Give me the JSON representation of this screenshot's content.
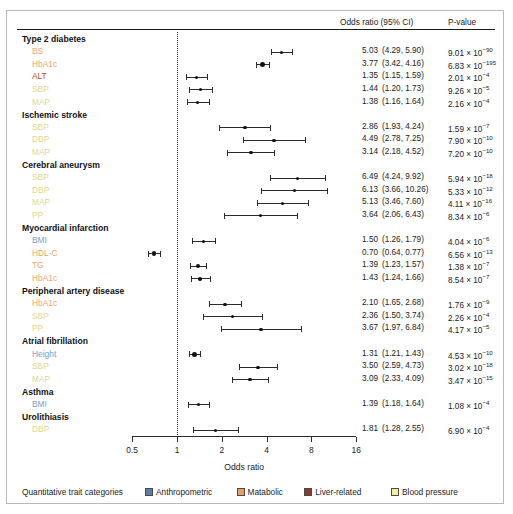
{
  "header": {
    "or_col": "Odds ratio (95% CI)",
    "p_col": "P-value"
  },
  "axis": {
    "title": "Odds ratio",
    "ticks": [
      "0.5",
      "1",
      "2",
      "4",
      "8",
      "16"
    ],
    "tick_values": [
      0.5,
      1,
      2,
      4,
      8,
      16
    ],
    "reference": 1
  },
  "legend": {
    "title": "Quantitative trait categories",
    "items": [
      {
        "label": "Anthropometric",
        "color": "#5b7fa6"
      },
      {
        "label": "Matabolic",
        "color": "#e8a05c"
      },
      {
        "label": "Liver-related",
        "color": "#8c3b22"
      },
      {
        "label": "Blood pressure",
        "color": "#f2f0a0"
      }
    ]
  },
  "colors": {
    "anthropometric": "#7b9ec4",
    "metabolic": "#eda96a",
    "liver": "#b2502f",
    "blood_pressure": "#ded98a"
  },
  "chart_data": {
    "type": "forest",
    "title": "",
    "xlabel": "Odds ratio",
    "ylabel": "",
    "xscale": "log2",
    "xlim": [
      0.5,
      16
    ],
    "xticks": [
      0.5,
      1,
      2,
      4,
      8,
      16
    ],
    "reference_line": 1,
    "grid": false,
    "legend_position": "bottom",
    "columns": [
      "Odds ratio (95% CI)",
      "P-value"
    ],
    "groups": [
      {
        "name": "Type 2 diabetes",
        "rows": [
          {
            "trait": "BS",
            "category": "metabolic",
            "or": 5.03,
            "lo": 4.29,
            "hi": 5.9,
            "or_text": "5.03",
            "ci_text": "(4.29,  5.90)",
            "p_mant": "9.01 × 10",
            "p_exp": "−90"
          },
          {
            "trait": "HbA1c",
            "category": "metabolic",
            "or": 3.77,
            "lo": 3.42,
            "hi": 4.16,
            "or_text": "3.77",
            "ci_text": "(3.42,  4.16)",
            "p_mant": "6.83 × 10",
            "p_exp": "−195"
          },
          {
            "trait": "ALT",
            "category": "liver",
            "or": 1.35,
            "lo": 1.15,
            "hi": 1.59,
            "or_text": "1.35",
            "ci_text": "(1.15,  1.59)",
            "p_mant": "2.01 × 10",
            "p_exp": "−4"
          },
          {
            "trait": "SBP",
            "category": "blood_pressure",
            "or": 1.44,
            "lo": 1.2,
            "hi": 1.73,
            "or_text": "1.44",
            "ci_text": "(1.20,  1.73)",
            "p_mant": "9.26 × 10",
            "p_exp": "−5"
          },
          {
            "trait": "MAP",
            "category": "blood_pressure",
            "or": 1.38,
            "lo": 1.16,
            "hi": 1.64,
            "or_text": "1.38",
            "ci_text": "(1.16,  1.64)",
            "p_mant": "2.16 × 10",
            "p_exp": "−4"
          }
        ]
      },
      {
        "name": "Ischemic stroke",
        "rows": [
          {
            "trait": "SBP",
            "category": "blood_pressure",
            "or": 2.86,
            "lo": 1.93,
            "hi": 4.24,
            "or_text": "2.86",
            "ci_text": "(1.93,  4.24)",
            "p_mant": "1.59 × 10",
            "p_exp": "−7"
          },
          {
            "trait": "DBP",
            "category": "blood_pressure",
            "or": 4.49,
            "lo": 2.78,
            "hi": 7.25,
            "or_text": "4.49",
            "ci_text": "(2.78,  7.25)",
            "p_mant": "7.90 × 10",
            "p_exp": "−10"
          },
          {
            "trait": "MAP",
            "category": "blood_pressure",
            "or": 3.14,
            "lo": 2.18,
            "hi": 4.52,
            "or_text": "3.14",
            "ci_text": "(2.18,  4.52)",
            "p_mant": "7.20 × 10",
            "p_exp": "−10"
          }
        ]
      },
      {
        "name": "Cerebral aneurysm",
        "rows": [
          {
            "trait": "SBP",
            "category": "blood_pressure",
            "or": 6.49,
            "lo": 4.24,
            "hi": 9.92,
            "or_text": "6.49",
            "ci_text": "(4.24,  9.92)",
            "p_mant": "5.94 × 10",
            "p_exp": "−18"
          },
          {
            "trait": "DBP",
            "category": "blood_pressure",
            "or": 6.13,
            "lo": 3.66,
            "hi": 10.26,
            "or_text": "6.13",
            "ci_text": "(3.66, 10.26)",
            "p_mant": "5.33 × 10",
            "p_exp": "−12"
          },
          {
            "trait": "MAP",
            "category": "blood_pressure",
            "or": 5.13,
            "lo": 3.46,
            "hi": 7.6,
            "or_text": "5.13",
            "ci_text": "(3.46,  7.60)",
            "p_mant": "4.11 × 10",
            "p_exp": "−16"
          },
          {
            "trait": "PP",
            "category": "blood_pressure",
            "or": 3.64,
            "lo": 2.06,
            "hi": 6.43,
            "or_text": "3.64",
            "ci_text": "(2.06,  6.43)",
            "p_mant": "8.34 × 10",
            "p_exp": "−6"
          }
        ]
      },
      {
        "name": "Myocardial infarction",
        "rows": [
          {
            "trait": "BMI",
            "category": "anthropometric",
            "or": 1.5,
            "lo": 1.26,
            "hi": 1.79,
            "or_text": "1.50",
            "ci_text": "(1.26,  1.79)",
            "p_mant": "4.04 × 10",
            "p_exp": "−6"
          },
          {
            "trait": "HDL-C",
            "category": "metabolic",
            "or": 0.7,
            "lo": 0.64,
            "hi": 0.77,
            "or_text": "0.70",
            "ci_text": "(0.64,  0.77)",
            "p_mant": "6.56 × 10",
            "p_exp": "−13"
          },
          {
            "trait": "TG",
            "category": "metabolic",
            "or": 1.39,
            "lo": 1.23,
            "hi": 1.57,
            "or_text": "1.39",
            "ci_text": "(1.23,  1.57)",
            "p_mant": "1.38 × 10",
            "p_exp": "−7"
          },
          {
            "trait": "HbA1c",
            "category": "metabolic",
            "or": 1.43,
            "lo": 1.24,
            "hi": 1.66,
            "or_text": "1.43",
            "ci_text": "(1.24,  1.66)",
            "p_mant": "8.54 × 10",
            "p_exp": "−7"
          }
        ]
      },
      {
        "name": "Peripheral artery disease",
        "rows": [
          {
            "trait": "HbA1c",
            "category": "metabolic",
            "or": 2.1,
            "lo": 1.65,
            "hi": 2.68,
            "or_text": "2.10",
            "ci_text": "(1.65,  2.68)",
            "p_mant": "1.76 × 10",
            "p_exp": "−9"
          },
          {
            "trait": "SBP",
            "category": "blood_pressure",
            "or": 2.36,
            "lo": 1.5,
            "hi": 3.74,
            "or_text": "2.36",
            "ci_text": "(1.50,  3.74)",
            "p_mant": "2.26 × 10",
            "p_exp": "−4"
          },
          {
            "trait": "PP",
            "category": "blood_pressure",
            "or": 3.67,
            "lo": 1.97,
            "hi": 6.84,
            "or_text": "3.67",
            "ci_text": "(1.97,  6.84)",
            "p_mant": "4.17 × 10",
            "p_exp": "−5"
          }
        ]
      },
      {
        "name": "Atrial fibrillation",
        "rows": [
          {
            "trait": "Height",
            "category": "anthropometric",
            "or": 1.31,
            "lo": 1.21,
            "hi": 1.43,
            "or_text": "1.31",
            "ci_text": "(1.21,  1.43)",
            "p_mant": "4.53 × 10",
            "p_exp": "−10"
          },
          {
            "trait": "SBP",
            "category": "blood_pressure",
            "or": 3.5,
            "lo": 2.59,
            "hi": 4.73,
            "or_text": "3.50",
            "ci_text": "(2.59,  4.73)",
            "p_mant": "3.02 × 10",
            "p_exp": "−18"
          },
          {
            "trait": "MAP",
            "category": "blood_pressure",
            "or": 3.09,
            "lo": 2.33,
            "hi": 4.09,
            "or_text": "3.09",
            "ci_text": "(2.33,  4.09)",
            "p_mant": "3.47 × 10",
            "p_exp": "−15"
          }
        ]
      },
      {
        "name": "Asthma",
        "rows": [
          {
            "trait": "BMI",
            "category": "anthropometric",
            "or": 1.39,
            "lo": 1.18,
            "hi": 1.64,
            "or_text": "1.39",
            "ci_text": "(1.18,  1.64)",
            "p_mant": "1.08 × 10",
            "p_exp": "−4"
          }
        ]
      },
      {
        "name": "Urolithiasis",
        "rows": [
          {
            "trait": "DBP",
            "category": "blood_pressure",
            "or": 1.81,
            "lo": 1.28,
            "hi": 2.55,
            "or_text": "1.81",
            "ci_text": "(1.28,  2.55)",
            "p_mant": "6.90 × 10",
            "p_exp": "−4"
          }
        ]
      }
    ]
  }
}
